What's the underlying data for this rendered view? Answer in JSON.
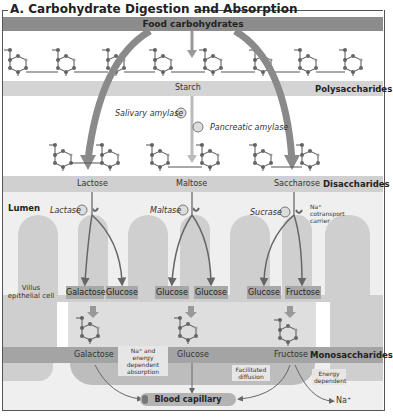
{
  "title": "A. Carbohydrate Digestion and Absorption",
  "bands": {
    "food": "Food carbohydrates",
    "starch": "Starch",
    "polysaccharides": "Polysaccharides",
    "disaccharides_label": "Disaccharides",
    "monosaccharides_label": "Monosaccharides"
  },
  "enzymes": {
    "salivary": "Salivary amylase",
    "pancreatic": "Pancreatic amylase",
    "lactase": "Lactase",
    "maltase": "Maltase",
    "sucrase": "Sucrase"
  },
  "disaccharides": [
    "Lactose",
    "Maltose",
    "Saccharose"
  ],
  "lumen": "Lumen",
  "carrier": {
    "line1": "Na⁺",
    "line2": "cotransport",
    "line3": "carrier"
  },
  "villus_cell": {
    "line1": "Villus",
    "line2": "epithelial cell"
  },
  "products": [
    "Galactose",
    "Glucose",
    "Glucose",
    "Glucose",
    "Glucose",
    "Fructose"
  ],
  "monosaccharides": [
    "Galactose",
    "Glucose",
    "Fructose"
  ],
  "callouts": {
    "na_energy": {
      "line1": "Na⁺ and energy",
      "line2": "dependent",
      "line3": "absorption"
    },
    "facilitated": {
      "line1": "Facilitated",
      "line2": "diffusion"
    },
    "energy": {
      "line1": "Energy",
      "line2": "dependent"
    }
  },
  "capillary": "Blood capillary",
  "na_out": "Na⁺"
}
